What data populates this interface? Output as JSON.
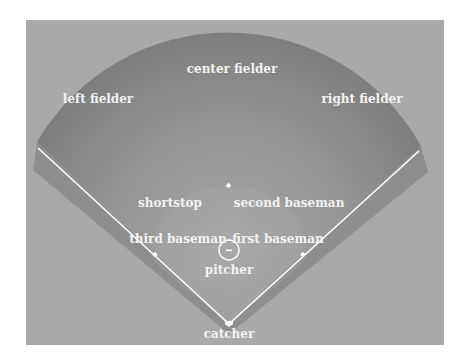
{
  "diagram": {
    "type": "baseball field positions",
    "colors": {
      "page_background": "#ffffff",
      "panel_background": "#a9a9a9",
      "outfield": "#868686",
      "outfield_light": "#9a9a9a",
      "infield": "#a2a2a2",
      "foul_band": "#8c8c8c",
      "lines": "#ffffff",
      "label_text": "#f2f2f2"
    },
    "positions": {
      "center_fielder": "center fielder",
      "left_fielder": "left fielder",
      "right_fielder": "right fielder",
      "shortstop": "shortstop",
      "second_baseman": "second baseman",
      "third_baseman": "third baseman",
      "first_baseman": "first baseman",
      "pitcher": "pitcher",
      "catcher": "catcher"
    }
  }
}
